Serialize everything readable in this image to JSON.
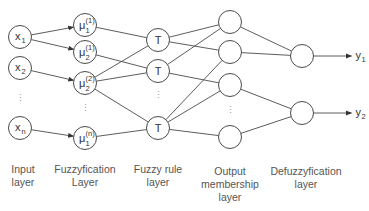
{
  "diagram": {
    "colors": {
      "stroke": "#4a4a4a",
      "text": "#333333",
      "label": "#555555",
      "background": "#ffffff"
    },
    "layers": [
      {
        "id": "input",
        "label_line1": "Input",
        "label_line2": "layer",
        "label_line3": ""
      },
      {
        "id": "fuzzification",
        "label_line1": "Fuzzyfication",
        "label_line2": "Layer",
        "label_line3": ""
      },
      {
        "id": "rule",
        "label_line1": "Fuzzy rule",
        "label_line2": "layer",
        "label_line3": ""
      },
      {
        "id": "output_membership",
        "label_line1": "Output",
        "label_line2": "membership",
        "label_line3": "layer"
      },
      {
        "id": "defuzzification",
        "label_line1": "Defuzzyfication",
        "label_line2": "layer",
        "label_line3": ""
      }
    ],
    "input_nodes": [
      {
        "id": "x1",
        "base": "x",
        "sub": "1",
        "sup": "",
        "cx": 20,
        "cy": 37
      },
      {
        "id": "x2",
        "base": "x",
        "sub": "2",
        "sup": "",
        "cx": 20,
        "cy": 68
      },
      {
        "id": "xn",
        "base": "x",
        "sub": "n",
        "sup": "",
        "cx": 20,
        "cy": 128
      }
    ],
    "fuzzification_nodes": [
      {
        "id": "m11",
        "base": "μ",
        "sub": "1",
        "sup": "(1)",
        "cx": 85,
        "cy": 25
      },
      {
        "id": "m21",
        "base": "μ",
        "sub": "2",
        "sup": "(1)",
        "cx": 85,
        "cy": 52
      },
      {
        "id": "m22",
        "base": "μ",
        "sub": "2",
        "sup": "(2)",
        "cx": 85,
        "cy": 83
      },
      {
        "id": "m1n",
        "base": "μ",
        "sub": "1",
        "sup": "(n)",
        "cx": 85,
        "cy": 138
      }
    ],
    "rule_nodes": [
      {
        "id": "T1",
        "base": "T",
        "cx": 158,
        "cy": 40
      },
      {
        "id": "T2",
        "base": "T",
        "cx": 158,
        "cy": 71
      },
      {
        "id": "T3",
        "base": "T",
        "cx": 158,
        "cy": 128
      }
    ],
    "output_membership_nodes": [
      {
        "id": "O1",
        "cx": 230,
        "cy": 22
      },
      {
        "id": "O2",
        "cx": 230,
        "cy": 52
      },
      {
        "id": "O3",
        "cx": 230,
        "cy": 85
      },
      {
        "id": "O4",
        "cx": 230,
        "cy": 137
      }
    ],
    "defuzzification_nodes": [
      {
        "id": "D1",
        "cx": 302,
        "cy": 56,
        "output": "y",
        "output_sub": "1"
      },
      {
        "id": "D2",
        "cx": 302,
        "cy": 113,
        "output": "y",
        "output_sub": "2"
      }
    ],
    "ellipses": [
      {
        "x": 20,
        "y": 98,
        "text": "⋮"
      },
      {
        "x": 85,
        "y": 108,
        "text": "⋮"
      },
      {
        "x": 158,
        "y": 95,
        "text": "⋮"
      },
      {
        "x": 230,
        "y": 110,
        "text": "⋮"
      }
    ],
    "edges": [
      {
        "from": "x1",
        "to": "m11",
        "arrow": true
      },
      {
        "from": "x1",
        "to": "m21",
        "arrow": true
      },
      {
        "from": "x2",
        "to": "m22",
        "arrow": true
      },
      {
        "from": "xn",
        "to": "m1n",
        "arrow": true
      },
      {
        "from": "m11",
        "to": "T1",
        "arrow": false
      },
      {
        "from": "m21",
        "to": "T2",
        "arrow": false
      },
      {
        "from": "m22",
        "to": "T1",
        "arrow": false
      },
      {
        "from": "m22",
        "to": "T2",
        "arrow": false
      },
      {
        "from": "m22",
        "to": "T3",
        "arrow": false
      },
      {
        "from": "m1n",
        "to": "T3",
        "arrow": false
      },
      {
        "from": "T1",
        "to": "O1",
        "arrow": false
      },
      {
        "from": "T1",
        "to": "O2",
        "arrow": false
      },
      {
        "from": "T2",
        "to": "O1",
        "arrow": false
      },
      {
        "from": "T2",
        "to": "O3",
        "arrow": false
      },
      {
        "from": "T3",
        "to": "O2",
        "arrow": false
      },
      {
        "from": "T3",
        "to": "O3",
        "arrow": false
      },
      {
        "from": "T3",
        "to": "O4",
        "arrow": false
      },
      {
        "from": "O1",
        "to": "D1",
        "arrow": false
      },
      {
        "from": "O2",
        "to": "D1",
        "arrow": false
      },
      {
        "from": "O3",
        "to": "D2",
        "arrow": false
      },
      {
        "from": "O4",
        "to": "D2",
        "arrow": false
      }
    ],
    "node_radius": 11.5,
    "output_arrow_length": 38
  }
}
